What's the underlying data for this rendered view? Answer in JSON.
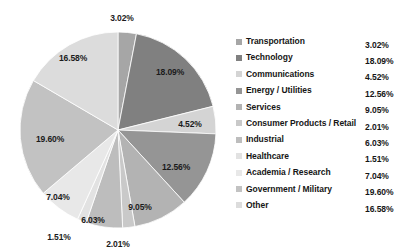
{
  "chart_data": {
    "type": "pie",
    "title": "",
    "legend_position": "right",
    "grid": false,
    "categories": [
      "Transportation",
      "Technology",
      "Communications",
      "Energy / Utilities",
      "Services",
      "Consumer Products / Retail",
      "Industrial",
      "Healthcare",
      "Academia / Research",
      "Government / Military",
      "Other"
    ],
    "values": [
      3.02,
      18.09,
      4.52,
      12.56,
      9.05,
      2.01,
      6.03,
      1.51,
      7.04,
      19.6,
      16.58
    ],
    "value_labels": [
      "3.02%",
      "18.09%",
      "4.52%",
      "12.56%",
      "9.05%",
      "2.01%",
      "6.03%",
      "1.51%",
      "7.04%",
      "19.60%",
      "16.58%"
    ],
    "colors": [
      "#a6a6a6",
      "#808080",
      "#d4d4d4",
      "#959595",
      "#b3b3b3",
      "#c9c9c9",
      "#bdbdbd",
      "#e2e2e2",
      "#e8e8e8",
      "#c2c2c2",
      "#dcdcdc"
    ],
    "units": "percent",
    "total": 100.01
  },
  "legend": {
    "items": [
      {
        "label": "Transportation",
        "value": "3.02%",
        "color": "#a6a6a6"
      },
      {
        "label": "Technology",
        "value": "18.09%",
        "color": "#808080"
      },
      {
        "label": "Communications",
        "value": "4.52%",
        "color": "#d4d4d4"
      },
      {
        "label": "Energy / Utilities",
        "value": "12.56%",
        "color": "#959595"
      },
      {
        "label": "Services",
        "value": "9.05%",
        "color": "#b3b3b3"
      },
      {
        "label": "Consumer Products / Retail",
        "value": "2.01%",
        "color": "#c9c9c9"
      },
      {
        "label": "Industrial",
        "value": "6.03%",
        "color": "#bdbdbd"
      },
      {
        "label": "Healthcare",
        "value": "1.51%",
        "color": "#e2e2e2"
      },
      {
        "label": "Academia / Research",
        "value": "7.04%",
        "color": "#e8e8e8"
      },
      {
        "label": "Government / Military",
        "value": "19.60%",
        "color": "#c2c2c2"
      },
      {
        "label": "Other",
        "value": "16.58%",
        "color": "#dcdcdc"
      }
    ]
  },
  "pie_geometry": {
    "cx": 118,
    "cy": 130,
    "r": 98,
    "start_angle_deg": -90,
    "direction": "clockwise",
    "label_positions": [
      {
        "x": 122,
        "y": 18,
        "text": "3.02%"
      },
      {
        "x": 170,
        "y": 72,
        "text": "18.09%"
      },
      {
        "x": 190,
        "y": 124,
        "text": "4.52%"
      },
      {
        "x": 176,
        "y": 167,
        "text": "12.56%"
      },
      {
        "x": 140,
        "y": 207,
        "text": "9.05%"
      },
      {
        "x": 118,
        "y": 244,
        "text": "2.01%"
      },
      {
        "x": 93,
        "y": 220,
        "text": "6.03%"
      },
      {
        "x": 59,
        "y": 237,
        "text": "1.51%"
      },
      {
        "x": 58,
        "y": 197,
        "text": "7.04%"
      },
      {
        "x": 50,
        "y": 139,
        "text": "19.60%"
      },
      {
        "x": 73,
        "y": 58,
        "text": "16.58%"
      }
    ]
  }
}
